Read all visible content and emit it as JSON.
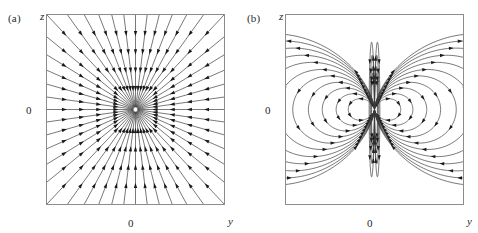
{
  "figure": {
    "kind": "vector-field-figure",
    "panel_count": 2,
    "background_color": "#ffffff",
    "frame_color": "#8c8c8c",
    "line_color": "#3a3a3a",
    "arrow_color": "#1a1a1a"
  },
  "panels": [
    {
      "tag": "(a)",
      "name": "radial-field",
      "x_axis_label": "y",
      "y_axis_label": "z",
      "x_tick_label": "0",
      "y_tick_label": "0"
    },
    {
      "tag": "(b)",
      "name": "dipole-field",
      "x_axis_label": "y",
      "y_axis_label": "z",
      "x_tick_label": "0",
      "y_tick_label": "0"
    }
  ],
  "chart_data": [
    {
      "type": "line",
      "subtype": "vector-field-streamplot",
      "panel": "(a)",
      "title": "",
      "xlabel": "y",
      "ylabel": "z",
      "xlim": [
        -1,
        1
      ],
      "ylim": [
        -1,
        1
      ],
      "xticks": [
        0
      ],
      "xticklabels": [
        "0"
      ],
      "yticks": [
        0
      ],
      "yticklabels": [
        "0"
      ],
      "grid": false,
      "legend": null,
      "field_description": "Radial field: straight streamlines directed inward along every ray toward the origin (point sink / monopole-like convergence).",
      "singularity": {
        "y": 0,
        "z": 0,
        "kind": "convergent-node"
      },
      "ray_count": 48,
      "ray_angles_deg": [
        0,
        7.5,
        15,
        22.5,
        30,
        37.5,
        45,
        52.5,
        60,
        67.5,
        75,
        82.5,
        90,
        97.5,
        105,
        112.5,
        120,
        127.5,
        135,
        142.5,
        150,
        157.5,
        165,
        172.5,
        180,
        187.5,
        195,
        202.5,
        210,
        217.5,
        225,
        232.5,
        240,
        247.5,
        255,
        262.5,
        270,
        277.5,
        285,
        292.5,
        300,
        307.5,
        315,
        322.5,
        330,
        337.5,
        345,
        352.5
      ],
      "arrow_direction": "inward",
      "arrows_per_ray": 4
    },
    {
      "type": "line",
      "subtype": "vector-field-streamplot",
      "panel": "(b)",
      "title": "",
      "xlabel": "y",
      "ylabel": "z",
      "xlim": [
        -1,
        1
      ],
      "ylim": [
        -1,
        1
      ],
      "xticks": [
        0
      ],
      "xticklabels": [
        "0"
      ],
      "yticks": [
        0
      ],
      "yticklabels": [
        "0"
      ],
      "grid": false,
      "legend": null,
      "field_description": "Dipole field: nested closed loops forming left and right lobes about the origin, with streamlines converging along the vertical axis at top and bottom.",
      "singularity": {
        "y": 0,
        "z": 0,
        "kind": "dipole-center"
      },
      "lobe_count": 2,
      "loops_per_lobe": 11,
      "loop_scales": [
        0.09,
        0.16,
        0.24,
        0.32,
        0.41,
        0.5,
        0.6,
        0.7,
        0.8,
        0.9,
        1.0
      ],
      "axis_lines_count": 8,
      "arrow_direction": "clockwise-right-lobe",
      "arrows_per_loop": 6
    }
  ]
}
